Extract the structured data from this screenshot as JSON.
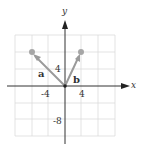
{
  "figure": {
    "axes": {
      "x_label": "x",
      "y_label": "y"
    },
    "ticks": {
      "x_neg": "-4",
      "x_pos": "4",
      "y_pos": "4",
      "y_neg": "-8"
    },
    "vectors": [
      {
        "name": "a",
        "tail": [
          0,
          0
        ],
        "head": [
          -8,
          8
        ]
      },
      {
        "name": "b",
        "tail": [
          0,
          0
        ],
        "head": [
          4,
          8
        ]
      }
    ],
    "grid": {
      "x_range": [
        -12,
        12
      ],
      "y_range": [
        -12,
        12
      ],
      "cell_units": 4
    },
    "colors": {
      "vector": "#999999",
      "grid": "#d9d9d9",
      "axis": "#333333",
      "point": "#a6a6a6"
    }
  }
}
